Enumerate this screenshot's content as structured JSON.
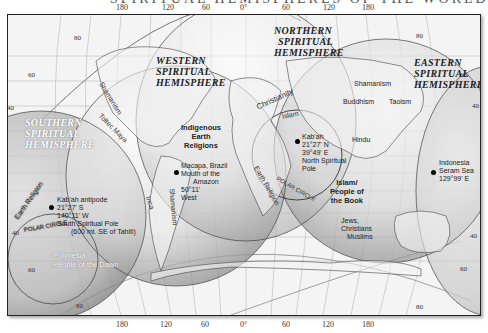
{
  "title_fragment": "SPIRITUAL HEMISPHERES OF THE WORLD",
  "longitude_ticks_top": [
    "180",
    "120",
    "60",
    "0°",
    "60",
    "120",
    "180"
  ],
  "longitude_ticks_bottom": [
    "180",
    "120",
    "60",
    "0°",
    "60",
    "120",
    "180"
  ],
  "latitude_labels": {
    "nw_80": "80",
    "nw_60": "60",
    "w_40": "40",
    "ne_80": "80",
    "ne_60": "60",
    "e_40": "40",
    "sw_40": "40",
    "sw_60": "60",
    "sw_80": "80",
    "se_40": "40",
    "se_60": "60",
    "se_80": "80"
  },
  "hemispheres": {
    "western": [
      "Western",
      "Spiritual",
      "Hemisphere"
    ],
    "northern": [
      "Northern",
      "Spiritual",
      "Hemisphere"
    ],
    "eastern": [
      "Eastern",
      "Spiritual",
      "Hemisphere"
    ],
    "southern": [
      "Southern",
      "Spiritual",
      "Hemisphere"
    ]
  },
  "religion_labels": {
    "indigenous": [
      "Indigenous",
      "Earth",
      "Religions"
    ],
    "islam_book": [
      "Islam/",
      "People of",
      "the Book"
    ],
    "jews": "Jews,",
    "christians": "Christians",
    "muslims": "Muslims",
    "shamanism_americas": "Shamanism",
    "toltec_maya": "Toltec Maya",
    "inca": "Inca",
    "shamanism_sa": "Shamanism",
    "christianity": "Christianity",
    "islam": "Islam",
    "earth_religion": "Earth Religion",
    "shamanism_asia": "Shamanism",
    "buddhism": "Buddhism",
    "taoism": "Taoism",
    "hindu": "Hindu",
    "earth_religion_pacific": "Earth Religion",
    "polynesia": "Polynesia",
    "people_dawn": "People of the Dawn"
  },
  "circles": {
    "polar_circle_north": "POLAR CIRCLE",
    "polar_circle_south": "POLAR CIRCLE"
  },
  "points": {
    "kabah": [
      "Kab'ah",
      "21°27' N",
      "39°49' E",
      "North Spiritual",
      "Pole"
    ],
    "antipode": [
      "Kab'ah antipode",
      "21°27' S",
      "140°11' W",
      "South Spiritual Pole",
      "(600 mi. SE of Tahiti)"
    ],
    "macapa": [
      "Macapa, Brazil",
      "Mouth of the",
      "Amazon",
      "50°11'",
      "West"
    ],
    "indonesia": [
      "Indonesia",
      "Seram Sea",
      "129°99' E"
    ]
  }
}
